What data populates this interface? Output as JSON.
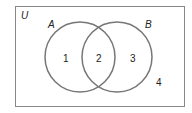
{
  "diagram": {
    "type": "venn",
    "universe_label": "U",
    "sets": [
      {
        "name": "A",
        "label": "A"
      },
      {
        "name": "B",
        "label": "B"
      }
    ],
    "regions": [
      {
        "id": "only-a",
        "label": "1"
      },
      {
        "id": "a-and-b",
        "label": "2"
      },
      {
        "id": "only-b",
        "label": "3"
      },
      {
        "id": "outside",
        "label": "4"
      }
    ],
    "colors": {
      "circle_stroke": "#777777",
      "box_stroke": "#888888",
      "text": "#222222"
    }
  }
}
